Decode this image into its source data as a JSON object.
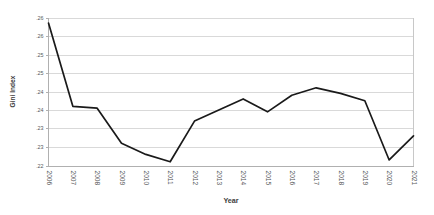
{
  "chart_data": {
    "type": "line",
    "title": "",
    "xlabel": "Year",
    "ylabel": "Gini Index",
    "grid": true,
    "legend": false,
    "legend_position": "none",
    "line_color": "#1a1a1a",
    "grid_color": "#d9d9d9",
    "x": [
      2006,
      2007,
      2008,
      2009,
      2010,
      2011,
      2012,
      2013,
      2014,
      2015,
      2016,
      2017,
      2018,
      2019,
      2020,
      2021
    ],
    "categories": [
      "2006",
      "2007",
      "2008",
      "2009",
      "2010",
      "2011",
      "2012",
      "2013",
      "2014",
      "2015",
      "2016",
      "2017",
      "2018",
      "2019",
      "2020",
      "2021"
    ],
    "values": [
      0.2585,
      0.236,
      0.2355,
      0.226,
      0.223,
      0.221,
      0.232,
      0.235,
      0.238,
      0.2345,
      0.239,
      0.241,
      0.2395,
      0.2375,
      0.2215,
      0.228
    ],
    "series": [
      {
        "name": "Gini Index",
        "values": [
          0.2585,
          0.236,
          0.2355,
          0.226,
          0.223,
          0.221,
          0.232,
          0.235,
          0.238,
          0.2345,
          0.239,
          0.241,
          0.2395,
          0.2375,
          0.2215,
          0.228
        ]
      }
    ],
    "ylim": [
      0.22,
      0.26
    ],
    "xlim": [
      2006,
      2021
    ],
    "ytick_values": [
      0.26,
      0.255,
      0.25,
      0.245,
      0.24,
      0.235,
      0.23,
      0.225,
      0.22
    ],
    "ytick_labels": [
      ".26",
      ".26",
      ".25",
      ".25",
      ".24",
      ".24",
      ".23",
      ".23",
      ".22"
    ],
    "xtick_labels": [
      "2006",
      "2007",
      "2008",
      "2009",
      "2010",
      "2011",
      "2012",
      "2013",
      "2014",
      "2015",
      "2016",
      "2017",
      "2018",
      "2019",
      "2020",
      "2021"
    ],
    "xtick_rotation": -90,
    "annotations": []
  }
}
